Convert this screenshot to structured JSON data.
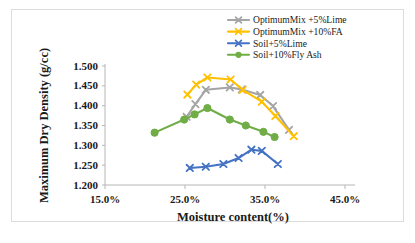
{
  "chart_data": {
    "type": "line",
    "title": "",
    "xlabel": "Moisture content(%)",
    "ylabel": "Maximum Dry Density (g/cc)",
    "xlim": [
      15.0,
      45.0
    ],
    "ylim": [
      1.2,
      1.5
    ],
    "xticks": [
      15.0,
      25.0,
      35.0,
      45.0
    ],
    "xtick_labels": [
      "15.0%",
      "25.0%",
      "35.0%",
      "45.0%"
    ],
    "yticks": [
      1.2,
      1.25,
      1.3,
      1.35,
      1.4,
      1.45,
      1.5
    ],
    "ytick_labels": [
      "1.200",
      "1.250",
      "1.300",
      "1.350",
      "1.400",
      "1.450",
      "1.500"
    ],
    "grid": false,
    "legend_position": "top-right",
    "series": [
      {
        "name": "OptimumMix +5%Lime",
        "color": "#A5A5A5",
        "marker": "x",
        "x": [
          25.2,
          26.3,
          27.6,
          30.6,
          32.1,
          34.4,
          36.0,
          38.0
        ],
        "y": [
          1.372,
          1.404,
          1.44,
          1.446,
          1.441,
          1.427,
          1.399,
          1.339
        ]
      },
      {
        "name": "OptimumMix +10%FA",
        "color": "#FFC000",
        "marker": "x",
        "x": [
          25.3,
          26.4,
          27.8,
          30.7,
          32.2,
          34.6,
          36.3,
          38.6
        ],
        "y": [
          1.428,
          1.453,
          1.471,
          1.466,
          1.44,
          1.41,
          1.374,
          1.323
        ]
      },
      {
        "name": "Soil+5%Lime",
        "color": "#4472C4",
        "marker": "x",
        "x": [
          25.6,
          27.6,
          29.8,
          31.7,
          33.3,
          34.6,
          36.6
        ],
        "y": [
          1.243,
          1.246,
          1.253,
          1.268,
          1.289,
          1.286,
          1.253
        ]
      },
      {
        "name": "Soil+10%Fly Ash",
        "color": "#70AD47",
        "marker": "circle",
        "x": [
          21.2,
          24.9,
          26.2,
          27.8,
          30.6,
          32.6,
          34.8,
          36.2
        ],
        "y": [
          1.332,
          1.365,
          1.378,
          1.394,
          1.365,
          1.35,
          1.334,
          1.321
        ]
      }
    ]
  },
  "legend": {
    "items": [
      {
        "label": "OptimumMix +5%Lime",
        "color": "#A5A5A5"
      },
      {
        "label": "OptimumMix +10%FA",
        "color": "#FFC000"
      },
      {
        "label": "Soil+5%Lime",
        "color": "#4472C4"
      },
      {
        "label": "Soil+10%Fly Ash",
        "color": "#70AD47"
      }
    ]
  },
  "axes": {
    "x_title": "Moisture content(%)",
    "y_title": "Maximum Dry Density (g/cc)",
    "x_tick_labels": [
      "15.0%",
      "25.0%",
      "35.0%",
      "45.0%"
    ],
    "y_tick_labels": [
      "1.500",
      "1.450",
      "1.400",
      "1.350",
      "1.300",
      "1.250",
      "1.200"
    ]
  }
}
